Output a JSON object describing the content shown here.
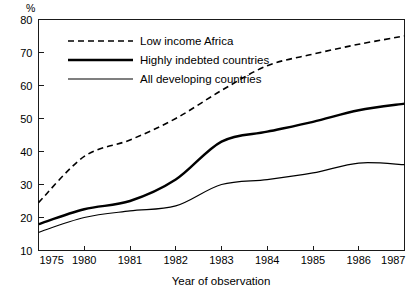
{
  "chart_data": {
    "type": "line",
    "title": "",
    "xlabel": "Year of observation",
    "ylabel": "%",
    "categories": [
      "1975",
      "1980",
      "1981",
      "1982",
      "1983",
      "1984",
      "1985",
      "1986",
      "1987"
    ],
    "ylim": [
      10,
      80
    ],
    "yticks": [
      10,
      20,
      30,
      40,
      50,
      60,
      70,
      80
    ],
    "ytick_labels": [
      "10",
      "20",
      "30",
      "40",
      "50",
      "60",
      "70",
      "80"
    ],
    "grid": false,
    "legend_position": "top-left-inside",
    "series": [
      {
        "name": "Low income Africa",
        "style": "dashed",
        "width": 1.6,
        "color": "#000000",
        "values": [
          24.5,
          38.5,
          43.5,
          50.0,
          58.5,
          66.0,
          69.5,
          72.5,
          75.0
        ]
      },
      {
        "name": "Highly indebted countries",
        "style": "solid",
        "width": 2.4,
        "color": "#000000",
        "values": [
          18.0,
          22.5,
          25.0,
          31.5,
          43.0,
          46.0,
          49.0,
          52.5,
          54.5
        ]
      },
      {
        "name": "All developing countries",
        "style": "solid",
        "width": 1.2,
        "color": "#000000",
        "values": [
          15.5,
          20.0,
          22.0,
          23.5,
          30.0,
          31.5,
          33.5,
          36.5,
          36.0
        ]
      }
    ]
  },
  "axis": {
    "unit_label": "%",
    "x_title": "Year of observation"
  },
  "legend": {
    "entries": [
      {
        "label": "Low income Africa",
        "style": "dashed"
      },
      {
        "label": "Highly indebted countries",
        "style": "solid-thick"
      },
      {
        "label": "All developing countries",
        "style": "solid-thin"
      }
    ]
  },
  "colors": {
    "ink": "#000000",
    "frame": "#1a1a1a",
    "background": "#ffffff"
  }
}
